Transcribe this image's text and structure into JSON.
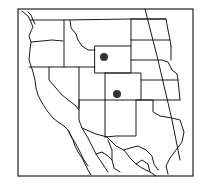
{
  "map": {
    "type": "range-map",
    "region": "Western United States and northern Mexico",
    "colors": {
      "line": "#1a1a1a",
      "frame": "#222222",
      "marker": "#333333",
      "background": "#ffffff"
    },
    "frame": {
      "x": 18,
      "y": 9,
      "width": 175,
      "height": 167
    },
    "markers": [
      {
        "id": "marker-1",
        "label": "Occurrence point (Wyoming)",
        "x": 104,
        "y": 57,
        "r": 4
      },
      {
        "id": "marker-2",
        "label": "Occurrence point (Colorado)",
        "x": 117,
        "y": 94,
        "r": 4
      }
    ],
    "features": [
      "state boundaries",
      "coastline",
      "Mexico state boundaries",
      "meridian line"
    ]
  }
}
